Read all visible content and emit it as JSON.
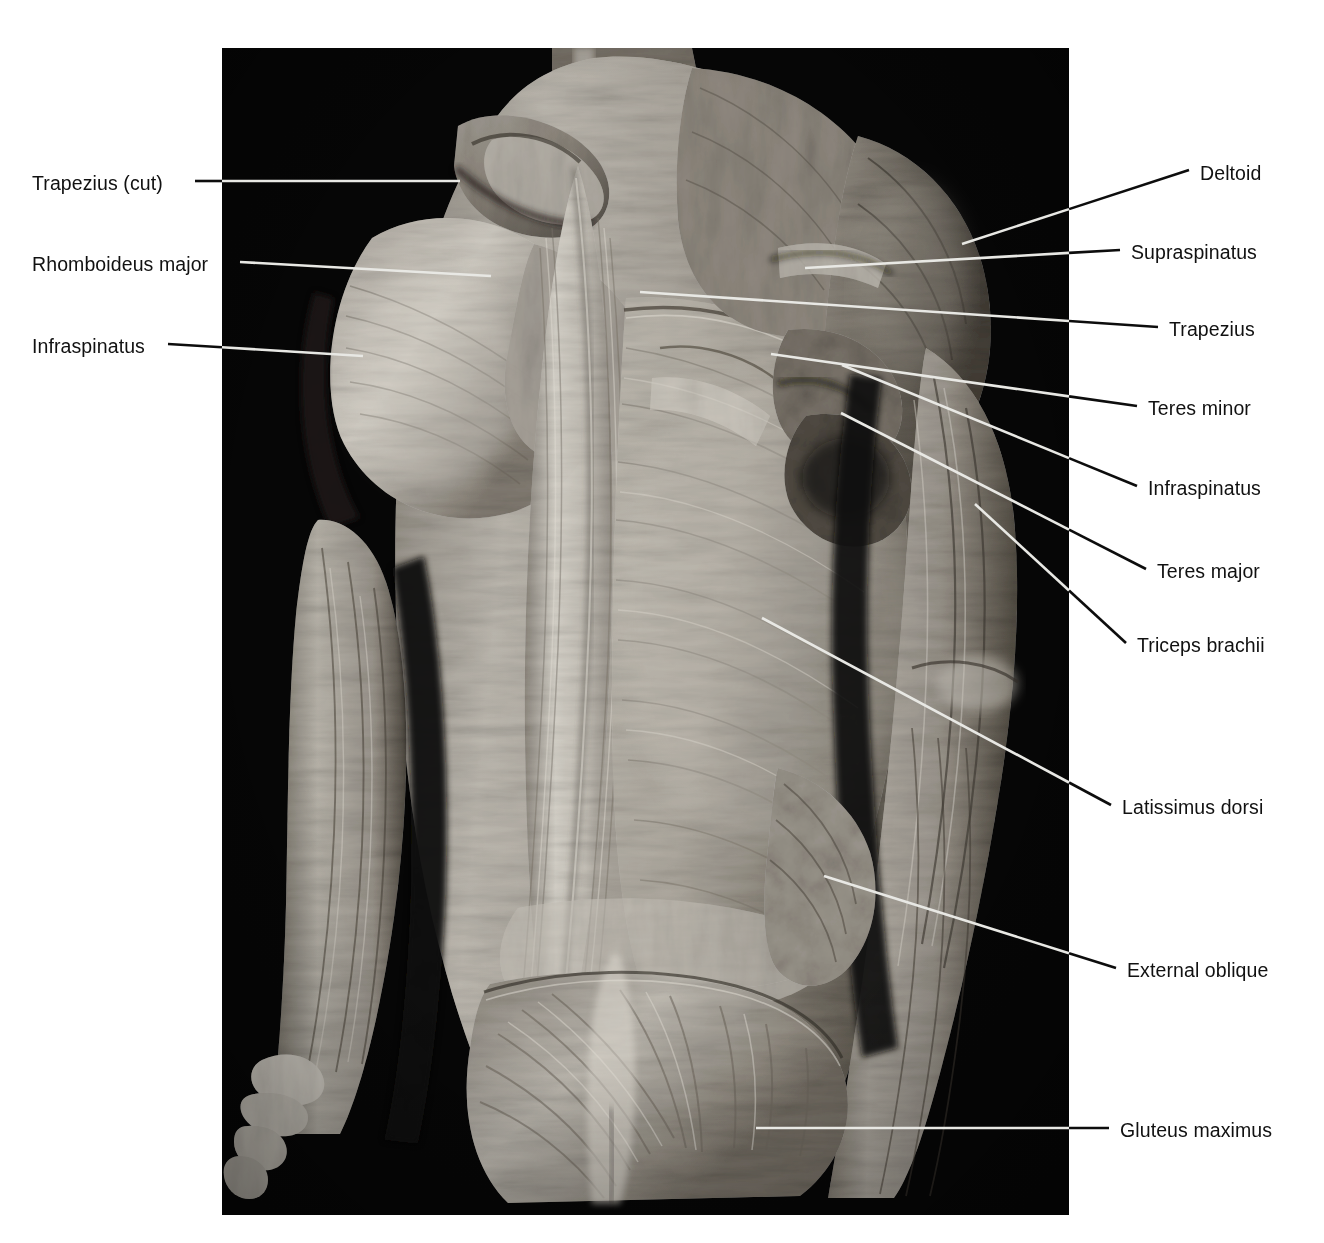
{
  "figure": {
    "kind": "anatomical-dissection-photograph",
    "background_color": "#ffffff",
    "plate_color": "#000000",
    "label_color": "#111111",
    "leader_color": "#0d0d0d",
    "leader_color_on_plate": "#e8e8e4"
  },
  "labels_left": [
    {
      "id": "trapezius-cut",
      "text": "Trapezius (cut)",
      "text_x": 32,
      "text_baseline_y": 188,
      "leader": [
        [
          195,
          181
        ],
        [
          460,
          181
        ]
      ]
    },
    {
      "id": "rhomboideus-major",
      "text": "Rhomboideus major",
      "text_x": 32,
      "text_baseline_y": 269,
      "leader": [
        [
          240,
          262
        ],
        [
          491,
          276
        ]
      ]
    },
    {
      "id": "infraspinatus-left",
      "text": "Infraspinatus",
      "text_x": 32,
      "text_baseline_y": 351,
      "leader": [
        [
          168,
          344
        ],
        [
          363,
          356
        ]
      ]
    }
  ],
  "labels_right": [
    {
      "id": "deltoid",
      "text": "Deltoid",
      "text_x": 1200,
      "text_baseline_y": 178,
      "leader": [
        [
          1189,
          170
        ],
        [
          962,
          244
        ]
      ]
    },
    {
      "id": "supraspinatus",
      "text": "Supraspinatus",
      "text_x": 1131,
      "text_baseline_y": 257,
      "leader": [
        [
          1120,
          250
        ],
        [
          805,
          268
        ]
      ]
    },
    {
      "id": "trapezius",
      "text": "Trapezius",
      "text_x": 1169,
      "text_baseline_y": 334,
      "leader": [
        [
          1158,
          327
        ],
        [
          640,
          292
        ]
      ]
    },
    {
      "id": "teres-minor",
      "text": "Teres minor",
      "text_x": 1148,
      "text_baseline_y": 413,
      "leader": [
        [
          1137,
          406
        ],
        [
          771,
          354
        ]
      ]
    },
    {
      "id": "infraspinatus-right",
      "text": "Infraspinatus",
      "text_x": 1148,
      "text_baseline_y": 493,
      "leader": [
        [
          1137,
          486
        ],
        [
          842,
          365
        ]
      ]
    },
    {
      "id": "teres-major",
      "text": "Teres major",
      "text_x": 1157,
      "text_baseline_y": 576,
      "leader": [
        [
          1146,
          569
        ],
        [
          841,
          413
        ]
      ]
    },
    {
      "id": "triceps-brachii",
      "text": "Triceps brachii",
      "text_x": 1137,
      "text_baseline_y": 650,
      "leader": [
        [
          1126,
          643
        ],
        [
          975,
          504
        ]
      ]
    },
    {
      "id": "latissimus-dorsi",
      "text": "Latissimus dorsi",
      "text_x": 1122,
      "text_baseline_y": 812,
      "leader": [
        [
          1111,
          805
        ],
        [
          762,
          618
        ]
      ]
    },
    {
      "id": "external-oblique",
      "text": "External oblique",
      "text_x": 1127,
      "text_baseline_y": 975,
      "leader": [
        [
          1116,
          968
        ],
        [
          824,
          876
        ]
      ]
    },
    {
      "id": "gluteus-maximus",
      "text": "Gluteus maximus",
      "text_x": 1120,
      "text_baseline_y": 1135,
      "leader": [
        [
          1109,
          1128
        ],
        [
          756,
          1128
        ]
      ]
    }
  ],
  "plate": {
    "x": 222,
    "y": 48,
    "width": 847,
    "height": 1167
  }
}
